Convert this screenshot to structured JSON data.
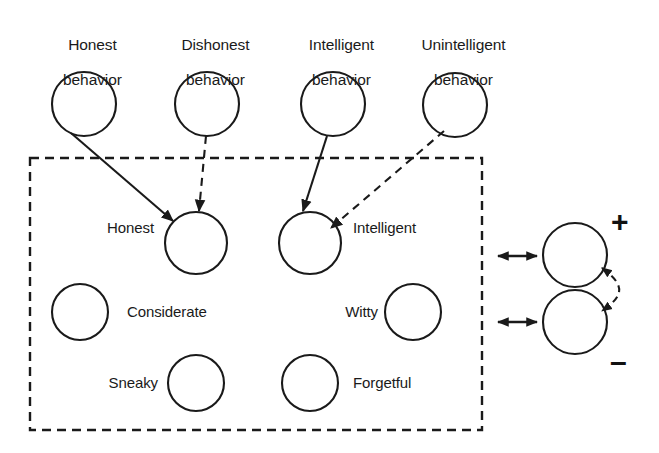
{
  "figure": {
    "type": "node-network-diagram",
    "background_color": "#ffffff",
    "stroke_color": "#1a1a1a",
    "width": 659,
    "height": 453
  },
  "behavior_nodes": [
    {
      "id": "honest-behavior",
      "label_line1": "Honest",
      "label_line2": "behavior",
      "cx": 84,
      "cy": 104,
      "r": 32,
      "label_x": 84,
      "label_y": 18
    },
    {
      "id": "dishonest-behavior",
      "label_line1": "Dishonest",
      "label_line2": "behavior",
      "cx": 207,
      "cy": 104,
      "r": 32,
      "label_x": 207,
      "label_y": 18
    },
    {
      "id": "intelligent-behavior",
      "label_line1": "Intelligent",
      "label_line2": "behavior",
      "cx": 333,
      "cy": 104,
      "r": 32,
      "label_x": 333,
      "label_y": 18
    },
    {
      "id": "unintelligent-behavior",
      "label_line1": "Unintelligent",
      "label_line2": "behavior",
      "cx": 455,
      "cy": 105,
      "r": 32,
      "label_x": 455,
      "label_y": 18
    }
  ],
  "trait_box": {
    "x": 30,
    "y": 158,
    "width": 452,
    "height": 272,
    "border_style": "dashed"
  },
  "trait_nodes": [
    {
      "id": "honest",
      "label": "Honest",
      "cx": 196,
      "cy": 243,
      "r": 31,
      "label_side": "left",
      "label_x": 92,
      "label_y": 234
    },
    {
      "id": "intelligent",
      "label": "Intelligent",
      "cx": 310,
      "cy": 243,
      "r": 31,
      "label_side": "right",
      "label_x": 355,
      "label_y": 234
    },
    {
      "id": "considerate",
      "label": "Considerate",
      "cx": 80,
      "cy": 312,
      "r": 28,
      "label_side": "right",
      "label_x": 128,
      "label_y": 304
    },
    {
      "id": "witty",
      "label": "Witty",
      "cx": 413,
      "cy": 312,
      "r": 28,
      "label_side": "left",
      "label_x": 330,
      "label_y": 304
    },
    {
      "id": "sneaky",
      "label": "Sneaky",
      "cx": 196,
      "cy": 383,
      "r": 28,
      "label_side": "left",
      "label_x": 95,
      "label_y": 375
    },
    {
      "id": "forgetful",
      "label": "Forgetful",
      "cx": 310,
      "cy": 383,
      "r": 28,
      "label_side": "right",
      "label_x": 355,
      "label_y": 375
    }
  ],
  "valence_nodes": [
    {
      "id": "positive-node",
      "cx": 575,
      "cy": 255,
      "r": 32,
      "sign": "+",
      "sign_x": 612,
      "sign_y": 210
    },
    {
      "id": "negative-node",
      "cx": 575,
      "cy": 322,
      "r": 32,
      "sign": "–",
      "sign_x": 611,
      "sign_y": 352
    }
  ],
  "edges": [
    {
      "id": "honest-behavior-to-honest",
      "style": "solid",
      "arrow": "single",
      "from": "honest-behavior",
      "to": "honest"
    },
    {
      "id": "dishonest-behavior-to-honest",
      "style": "dashed",
      "arrow": "single",
      "from": "dishonest-behavior",
      "to": "honest"
    },
    {
      "id": "intelligent-behavior-to-intelligent",
      "style": "solid",
      "arrow": "single",
      "from": "intelligent-behavior",
      "to": "intelligent"
    },
    {
      "id": "unintelligent-behavior-to-intelligent",
      "style": "dashed",
      "arrow": "single",
      "from": "unintelligent-behavior",
      "to": "intelligent"
    },
    {
      "id": "trait-box-to-positive-node",
      "style": "solid",
      "arrow": "double",
      "from": "trait-box",
      "to": "positive-node"
    },
    {
      "id": "trait-box-to-negative-node",
      "style": "solid",
      "arrow": "double",
      "from": "trait-box",
      "to": "negative-node"
    },
    {
      "id": "positive-negative-link",
      "style": "dashed",
      "arrow": "double",
      "from": "positive-node",
      "to": "negative-node",
      "shape": "curved"
    }
  ]
}
